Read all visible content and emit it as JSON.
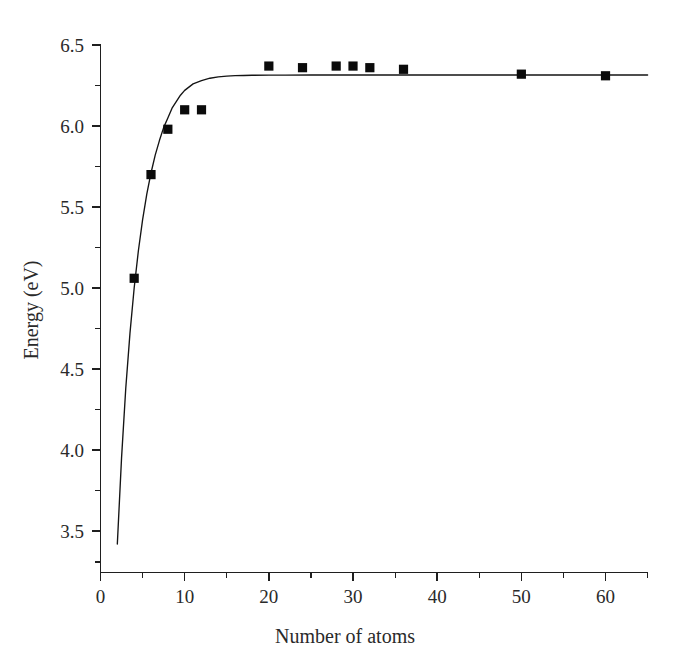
{
  "chart_data": {
    "type": "scatter",
    "title": "",
    "xlabel": "Number of atoms",
    "ylabel": "Energy (eV)",
    "xlim": [
      0,
      65
    ],
    "ylim": [
      3.25,
      6.62
    ],
    "grid": false,
    "legend": "none",
    "x_ticks_major": [
      0,
      10,
      20,
      30,
      40,
      50,
      60
    ],
    "x_ticks_minor": [
      5,
      15,
      25,
      35,
      45,
      55,
      65
    ],
    "y_ticks_major": [
      3.5,
      4.0,
      4.5,
      5.0,
      5.5,
      6.0,
      6.5
    ],
    "y_ticks_minor": [
      3.75,
      4.25,
      4.75,
      5.25,
      5.75,
      6.25
    ],
    "x_tick_labels": [
      "0",
      "10",
      "20",
      "30",
      "40",
      "50",
      "60"
    ],
    "y_tick_labels": [
      "3.5",
      "4.0",
      "4.5",
      "5.0",
      "5.5",
      "6.0",
      "6.5"
    ],
    "series": [
      {
        "name": "data points",
        "type": "scatter",
        "marker": "square",
        "color": "#0b0b0b",
        "x": [
          4,
          6,
          8,
          10,
          12,
          20,
          24,
          28,
          30,
          32,
          36,
          50,
          60
        ],
        "y": [
          5.06,
          5.7,
          5.98,
          6.1,
          6.1,
          6.37,
          6.36,
          6.37,
          6.37,
          6.36,
          6.35,
          6.32,
          6.31
        ]
      },
      {
        "name": "fit curve",
        "type": "line",
        "color": "#141414",
        "asymptote": 6.315,
        "x": [
          2.0,
          2.5,
          3.0,
          3.5,
          4.0,
          4.5,
          5.0,
          5.5,
          6.0,
          6.5,
          7.0,
          7.5,
          8.0,
          8.5,
          9.0,
          9.5,
          10.0,
          11.0,
          12.0,
          13.0,
          14.0,
          15.0,
          16.0,
          17.0,
          18.0,
          20.0,
          22.0,
          25.0,
          30.0,
          35.0,
          40.0,
          45.0,
          50.0,
          55.0,
          60.0,
          65.0
        ],
        "y": [
          3.42,
          3.95,
          4.38,
          4.72,
          5.0,
          5.23,
          5.42,
          5.58,
          5.71,
          5.82,
          5.91,
          5.99,
          6.05,
          6.11,
          6.15,
          6.19,
          6.22,
          6.26,
          6.28,
          6.295,
          6.303,
          6.308,
          6.311,
          6.312,
          6.313,
          6.314,
          6.3145,
          6.315,
          6.315,
          6.315,
          6.315,
          6.315,
          6.315,
          6.315,
          6.315,
          6.315
        ]
      }
    ]
  },
  "figure": {
    "background_color": "#ffffff",
    "axis_color": "#1f1f1f",
    "marker_color": "#0b0b0b",
    "curve_color": "#141414"
  }
}
